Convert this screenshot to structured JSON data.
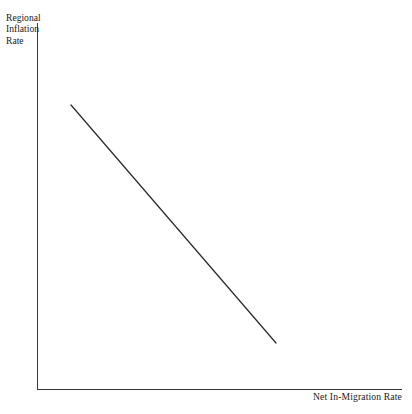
{
  "chart_data": {
    "type": "line",
    "title": "",
    "subtitle": "",
    "xlabel": "Net In-Migration Rate",
    "ylabel": "Regional Inflation Rate",
    "ylabel_lines": [
      "Regional",
      "Inflation",
      "Rate"
    ],
    "grid": false,
    "legend": "none",
    "axis_ticks": "none",
    "tick_labels": [],
    "annotations": [],
    "xlim": [
      0,
      1
    ],
    "ylim": [
      0,
      1
    ],
    "series": [
      {
        "name": "Inflation-migration relationship",
        "type": "line",
        "style": "solid",
        "color": "#2b2b2b",
        "relationship": "negative",
        "x": [
          0.0959,
          0.5726
        ],
        "y": [
          0.7766,
          0.1281
        ],
        "points_px": [
          [
            71,
            105
          ],
          [
            276,
            343
          ]
        ],
        "slope_px": -1.161,
        "description": "Straight downward-sloping line from upper-left to lower-right indicating an inverse relationship"
      }
    ]
  },
  "axes": {
    "y_axis": {
      "label": "Regional Inflation Rate",
      "color": "#3a3a3a",
      "x_px": 37,
      "top_px": 23,
      "bottom_px": 390
    },
    "x_axis": {
      "label": "Net In-Migration Rate",
      "color": "#3a3a3a",
      "y_px": 389,
      "left_px": 37,
      "right_px": 402
    }
  },
  "labels": {
    "y_line_1": "Regional",
    "y_line_2": "Inflation",
    "y_line_3": "Rate",
    "x_title": "Net In-Migration Rate"
  },
  "colors": {
    "background": "#ffffff",
    "axis": "#3a3a3a",
    "curve": "#2b2b2b",
    "text": "#1a1a1a"
  }
}
